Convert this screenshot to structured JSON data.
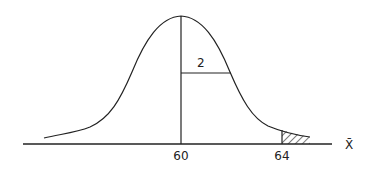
{
  "diagram": {
    "type": "normal-distribution-curve",
    "mean_label": "60",
    "cutoff_label": "64",
    "sd_label": "2",
    "axis_label": "X̄",
    "shaded_region": "right tail beyond 64",
    "colors": {
      "stroke": "#222222",
      "background": "#ffffff"
    }
  }
}
